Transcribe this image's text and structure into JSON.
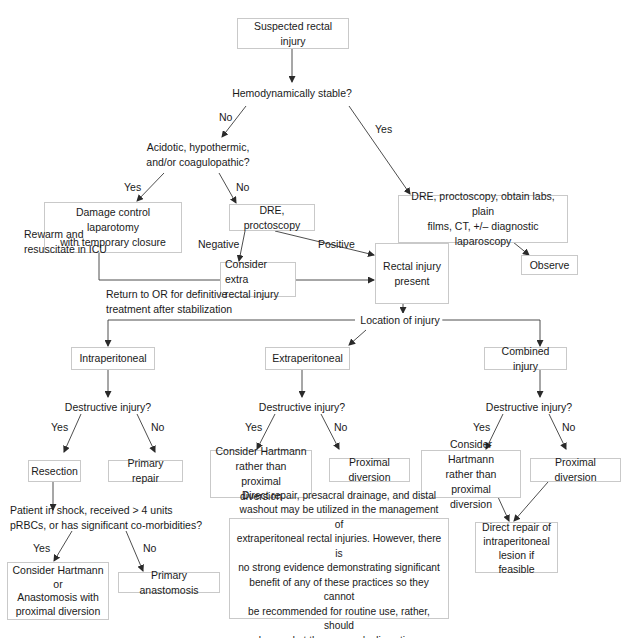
{
  "flowchart": {
    "start": "Suspected rectal injury",
    "q_hemodynamic": "Hemodynamically stable?",
    "q_acidotic": "Acidotic, hypothermic,\nand/or coagulopathic?",
    "damage_control": "Damage control laparotomy\nwith temporary closure",
    "dre_proctoscopy": "DRE, proctoscopy",
    "dre_full_workup": "DRE, proctoscopy, obtain labs, plain\nfilms, CT, +/– diagnostic laparoscopy",
    "consider_extra": "Consider extra\nrectal injury",
    "rectal_injury_present": "Rectal injury\npresent",
    "observe": "Observe",
    "rewarm": "Rewarm and\nresuscitate in ICU",
    "return_or": "Return to OR for definitive\ntreatment after stabilization",
    "location": "Location of injury",
    "intraperitoneal": "Intraperitoneal",
    "extraperitoneal": "Extraperitoneal",
    "combined": "Combined injury",
    "q_destructive": "Destructive injury?",
    "resection": "Resection",
    "primary_repair": "Primary repair",
    "hartmann_vs_diversion": "Consider Hartmann\nrather than proximal\ndiversion",
    "proximal_diversion": "Proximal diversion",
    "q_shock": "Patient in shock, received > 4 units\npRBCs, or has significant co-morbidities?",
    "hartmann_or_anastomosis": "Consider Hartmann\nor\nAnastomosis with\nproximal diversion",
    "primary_anastomosis": "Primary anastomosis",
    "direct_repair": "Direct repair of\nintraperitoneal\nlesion if feasible",
    "note": "Direct repair, presacral drainage, and distal\nwashout may be utilized in the management of\nextraperitoneal rectal injuries. However, there is\nno strong evidence demonstrating significant\nbenefit of any of these practices so they cannot\nbe recommended for routine use, rather, should\nbe used at the surgeon's discretion."
  },
  "edge_labels": {
    "no": "No",
    "yes": "Yes",
    "negative": "Negative",
    "positive": "Positive"
  },
  "colors": {
    "line": "#3a3a3a",
    "box_border": "#c9c9c9",
    "text": "#1a1a1a"
  }
}
